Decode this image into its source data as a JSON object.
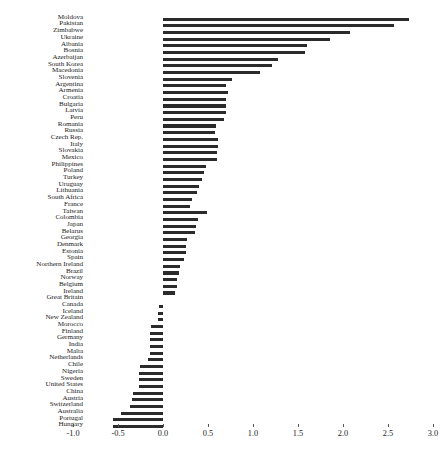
{
  "chart_data": {
    "type": "bar",
    "orientation": "horizontal",
    "title": "",
    "xlabel": "",
    "ylabel": "",
    "xlim": [
      -1.0,
      3.0
    ],
    "xticks": [
      -1.0,
      -0.5,
      0.0,
      0.5,
      1.0,
      1.5,
      2.0,
      2.5,
      3.0
    ],
    "xtick_labels": [
      "-1.0",
      "-0.5",
      "0.0",
      "0.5",
      "1.0",
      "1.5",
      "2.0",
      "2.5",
      "3.0"
    ],
    "grid": false,
    "legend": null,
    "bar_color": "#2b2b2b",
    "categories": [
      "Moldova",
      "Pakistan",
      "Zimbabwe",
      "Ukraine",
      "Albania",
      "Bosnia",
      "Azerbaijan",
      "South Korea",
      "Macedonia",
      "Slovenia",
      "Argentina",
      "Armenia",
      "Croatia",
      "Bulgaria",
      "Latvia",
      "Peru",
      "Romania",
      "Russia",
      "Czech Rep.",
      "Italy",
      "Slovakia",
      "Mexico",
      "Philippines",
      "Poland",
      "Turkey",
      "Uruguay",
      "Lithuania",
      "South Africa",
      "France",
      "Taiwan",
      "Colombia",
      "Japan",
      "Belarus",
      "Georgia",
      "Denmark",
      "Estonia",
      "Spain",
      "Northern Ireland",
      "Brazil",
      "Norway",
      "Belgium",
      "Ireland",
      "Great Britain",
      "Canada",
      "Iceland",
      "New Zealand",
      "Morocco",
      "Finland",
      "Germany",
      "India",
      "Malta",
      "Netherlands",
      "Chile",
      "Nigeria",
      "Sweden",
      "United States",
      "China",
      "Austria",
      "Switzerland",
      "Australia",
      "Portugal",
      "Hungary"
    ],
    "values": [
      2.73,
      2.57,
      2.08,
      1.86,
      1.6,
      1.58,
      1.28,
      1.21,
      1.08,
      0.77,
      0.7,
      0.72,
      0.7,
      0.7,
      0.7,
      0.68,
      0.59,
      0.58,
      0.61,
      0.61,
      0.6,
      0.6,
      0.48,
      0.46,
      0.43,
      0.4,
      0.38,
      0.32,
      0.3,
      0.49,
      0.39,
      0.37,
      0.36,
      0.27,
      0.26,
      0.25,
      0.23,
      0.19,
      0.18,
      0.16,
      0.15,
      0.13,
      0.0,
      -0.05,
      -0.06,
      -0.06,
      -0.13,
      -0.15,
      -0.15,
      -0.15,
      -0.15,
      -0.17,
      -0.26,
      -0.27,
      -0.27,
      -0.27,
      -0.33,
      -0.35,
      -0.37,
      -0.47,
      -0.56,
      -0.56
    ]
  },
  "caption": {
    "text": ""
  }
}
